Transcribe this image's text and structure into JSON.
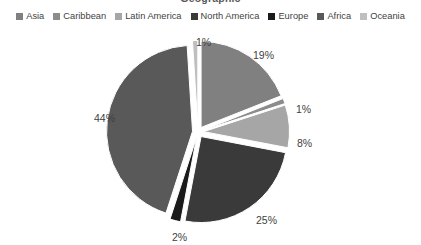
{
  "chart_data": {
    "type": "pie",
    "title": "Geographic",
    "categories": [
      "Asia",
      "Caribbean",
      "Latin America",
      "North America",
      "Europe",
      "Africa",
      "Oceania"
    ],
    "values": [
      19,
      1,
      8,
      25,
      2,
      44,
      1
    ],
    "value_labels": [
      "19%",
      "1%",
      "8%",
      "25%",
      "2%",
      "44%",
      "1%"
    ],
    "colors": [
      "#808080",
      "#8C8C8C",
      "#A6A6A6",
      "#3A3A3A",
      "#1A1A1A",
      "#595959",
      "#BFBFBF"
    ],
    "xlabel": "",
    "ylabel": "",
    "legend_position": "top",
    "exploded": true,
    "units": "percent"
  },
  "legend": {
    "items": [
      {
        "label": "Asia",
        "color": "#808080"
      },
      {
        "label": "Caribbean",
        "color": "#8C8C8C"
      },
      {
        "label": "Latin America",
        "color": "#A6A6A6"
      },
      {
        "label": "North America",
        "color": "#3A3A3A"
      },
      {
        "label": "Europe",
        "color": "#1A1A1A"
      },
      {
        "label": "Africa",
        "color": "#595959"
      },
      {
        "label": "Oceania",
        "color": "#BFBFBF"
      }
    ]
  },
  "labels": {
    "oceania": "1%",
    "asia": "19%",
    "caribbean": "1%",
    "latin_america": "8%",
    "north_america": "25%",
    "europe": "2%",
    "africa": "44%"
  }
}
